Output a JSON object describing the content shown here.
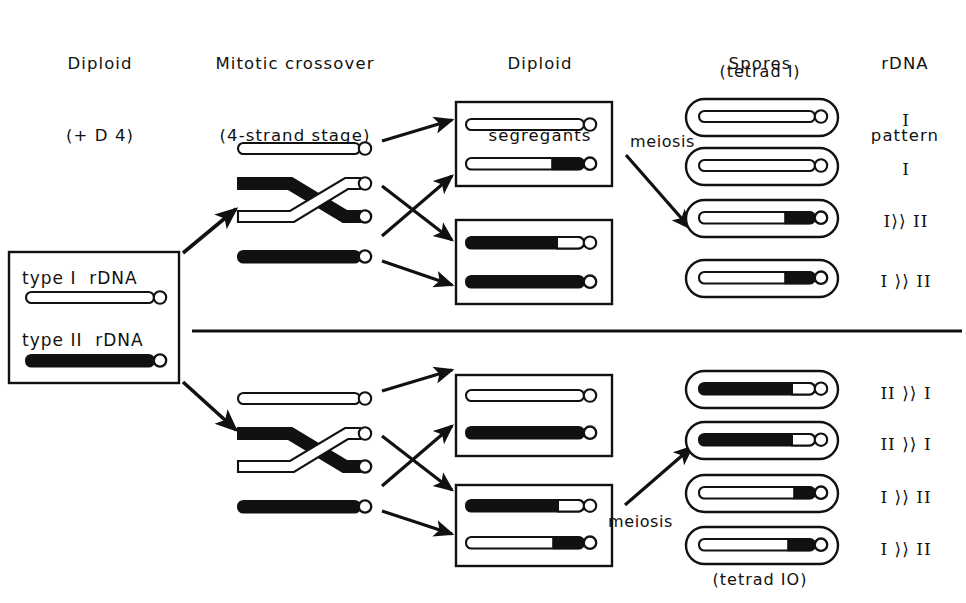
{
  "headers": {
    "col1_line1": "Diploid",
    "col1_line2": "(+ D 4)",
    "col2_line1": "Mitotic crossover",
    "col2_line2": "(4-strand stage)",
    "col3_line1": "Diploid",
    "col3_line2": "segregants",
    "col4_line1": "Spores",
    "col5_line1": "rDNA",
    "col5_line2": "pattern",
    "tetrad_top": "(tetrad I)",
    "tetrad_bottom": "(tetrad IO)"
  },
  "legend": {
    "type1_label": "type I  rDNA",
    "type2_label": "type II  rDNA",
    "type1_fill": "#ffffff",
    "type2_fill": "#111111"
  },
  "labels": {
    "meiosis_top": "meiosis",
    "meiosis_bottom": "meiosis"
  },
  "colors": {
    "ink": "#111111",
    "paper": "#ffffff",
    "type1": "#ffffff",
    "type2": "#111111"
  },
  "panels": [
    {
      "id": "top",
      "crossover": {
        "strand1": "type I (white)",
        "strand2": "type II proximal, type I distal (crossed)",
        "strand3": "type I proximal, type II distal (crossed)",
        "strand4": "type II (black)"
      },
      "segregant_boxes": [
        {
          "id": "top-box-a",
          "chromosomes": [
            {
              "proximal": "type1",
              "distal": "type1",
              "distal_fraction": 0.0
            },
            {
              "proximal": "type1",
              "distal": "type2",
              "distal_fraction": 0.27
            }
          ]
        },
        {
          "id": "top-box-b",
          "chromosomes": [
            {
              "proximal": "type2",
              "distal": "type1",
              "distal_fraction": 0.23
            },
            {
              "proximal": "type2",
              "distal": "type2",
              "distal_fraction": 0.0
            }
          ]
        }
      ],
      "spores": [
        {
          "proximal": "type1",
          "distal": "type1",
          "distal_fraction": 0.0,
          "pattern": "I"
        },
        {
          "proximal": "type1",
          "distal": "type1",
          "distal_fraction": 0.0,
          "pattern": "I"
        },
        {
          "proximal": "type1",
          "distal": "type2",
          "distal_fraction": 0.26,
          "pattern": "I⟩⟩ II"
        },
        {
          "proximal": "type1",
          "distal": "type2",
          "distal_fraction": 0.26,
          "pattern": "I ⟩⟩ II"
        }
      ]
    },
    {
      "id": "bottom",
      "crossover": {
        "strand1": "type I (white)",
        "strand2": "type II proximal, type I distal (crossed)",
        "strand3": "type I proximal, type II distal (crossed)",
        "strand4": "type II (black)"
      },
      "segregant_boxes": [
        {
          "id": "bottom-box-a",
          "chromosomes": [
            {
              "proximal": "type1",
              "distal": "type1",
              "distal_fraction": 0.0
            },
            {
              "proximal": "type2",
              "distal": "type2",
              "distal_fraction": 0.0
            }
          ]
        },
        {
          "id": "bottom-box-b",
          "chromosomes": [
            {
              "proximal": "type2",
              "distal": "type1",
              "distal_fraction": 0.22
            },
            {
              "proximal": "type1",
              "distal": "type2",
              "distal_fraction": 0.26
            }
          ]
        }
      ],
      "spores": [
        {
          "proximal": "type2",
          "distal": "type1",
          "distal_fraction": 0.2,
          "pattern": "II ⟩⟩ I"
        },
        {
          "proximal": "type2",
          "distal": "type1",
          "distal_fraction": 0.2,
          "pattern": "II ⟩⟩ I"
        },
        {
          "proximal": "type1",
          "distal": "type2",
          "distal_fraction": 0.18,
          "pattern": "I ⟩⟩ II"
        },
        {
          "proximal": "type1",
          "distal": "type2",
          "distal_fraction": 0.22,
          "pattern": "I ⟩⟩ II"
        }
      ]
    }
  ]
}
